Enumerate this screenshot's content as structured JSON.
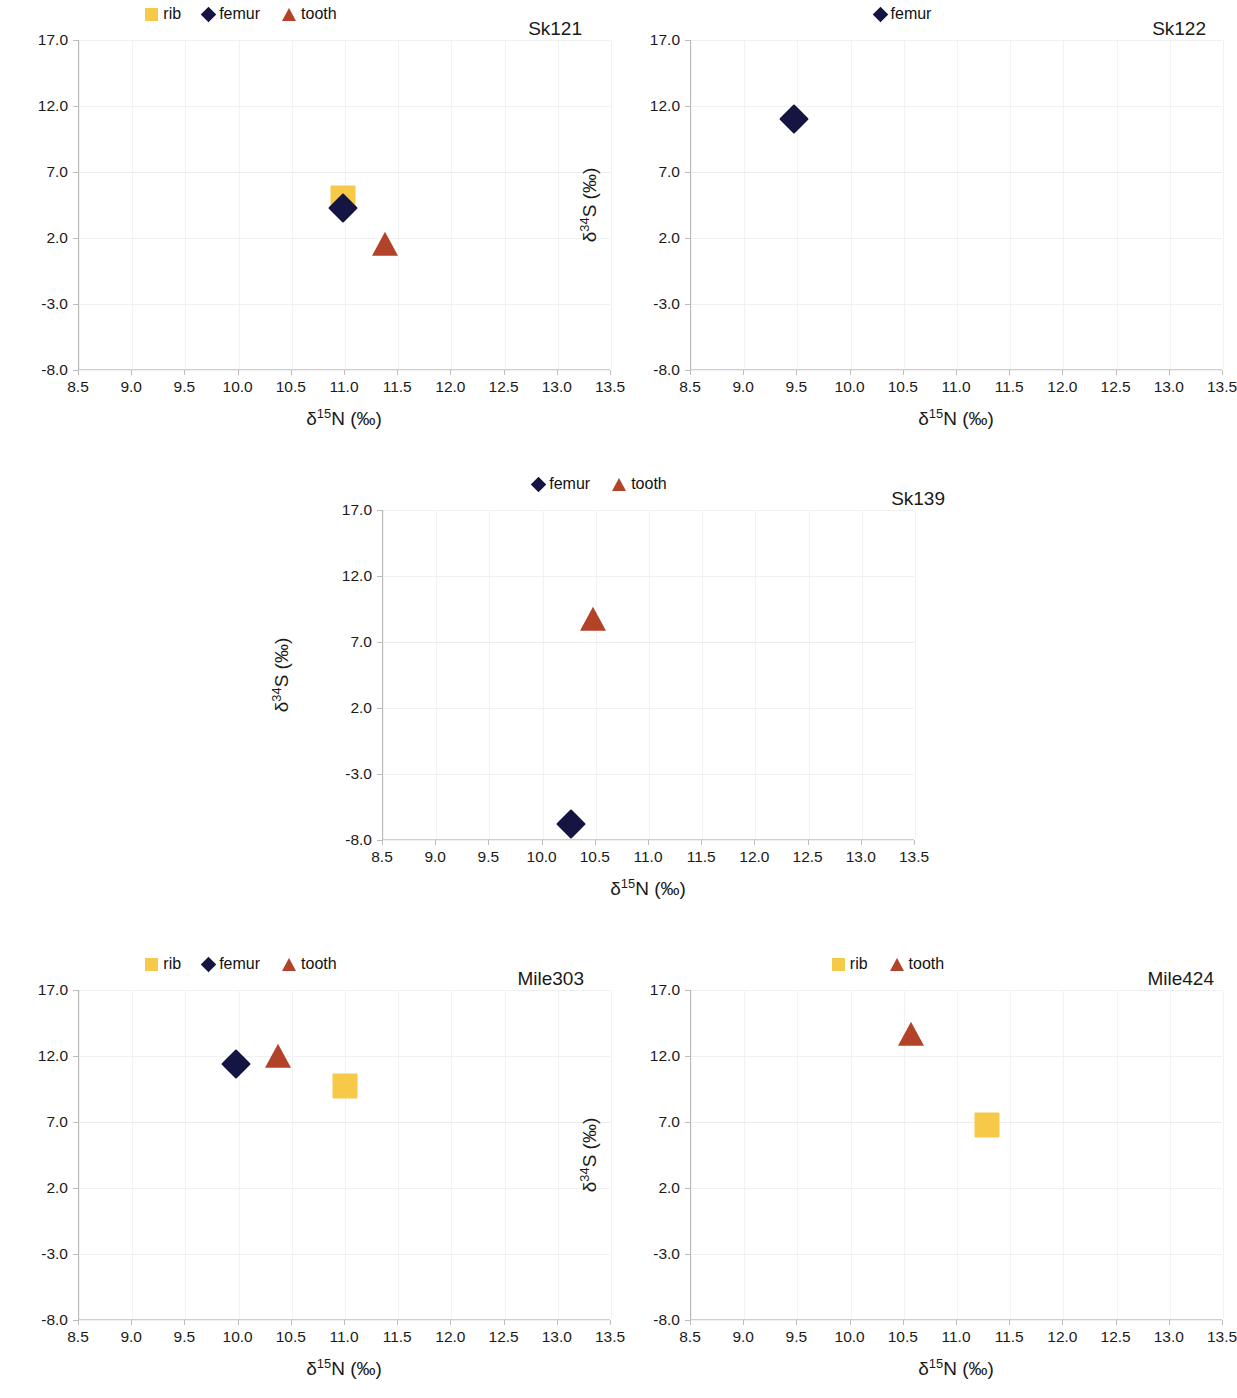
{
  "figure": {
    "axis_x_title_html": "&delta;<sup>15</sup>N (&permil;)",
    "axis_y_title_html": "&delta;<sup>34</sup>S (&permil;)",
    "colors": {
      "rib": "#f7c948",
      "femur": "#151544",
      "tooth": "#b24228",
      "gridline": "#f0f0f0",
      "axis": "#b9b9b9",
      "text": "#1a1a1a"
    }
  },
  "chart_data": [
    {
      "type": "scatter",
      "title": "Sk121",
      "xlabel": "δ15N (‰)",
      "ylabel": "δ34S (‰)",
      "xlim": [
        8.5,
        13.5
      ],
      "ylim": [
        -8.0,
        17.0
      ],
      "xticks": [
        "8.5",
        "9.0",
        "9.5",
        "10.0",
        "10.5",
        "11.0",
        "11.5",
        "12.0",
        "12.5",
        "13.0",
        "13.5"
      ],
      "yticks": [
        "17.0",
        "12.0",
        "7.0",
        "2.0",
        "-3.0",
        "-8.0"
      ],
      "grid": true,
      "legend_position": "top-center",
      "legend": [
        "rib",
        "femur",
        "tooth"
      ],
      "series": [
        {
          "name": "rib",
          "marker": "square",
          "x": [
            10.98
          ],
          "y": [
            5.0
          ]
        },
        {
          "name": "femur",
          "marker": "diamond",
          "x": [
            10.98
          ],
          "y": [
            4.3
          ]
        },
        {
          "name": "tooth",
          "marker": "triangle",
          "x": [
            11.38
          ],
          "y": [
            1.5
          ]
        }
      ]
    },
    {
      "type": "scatter",
      "title": "Sk122",
      "xlabel": "δ15N (‰)",
      "ylabel": "δ34S (‰)",
      "xlim": [
        8.5,
        13.5
      ],
      "ylim": [
        -8.0,
        17.0
      ],
      "xticks": [
        "8.5",
        "9.0",
        "9.5",
        "10.0",
        "10.5",
        "11.0",
        "11.5",
        "12.0",
        "12.5",
        "13.0",
        "13.5"
      ],
      "yticks": [
        "17.0",
        "12.0",
        "7.0",
        "2.0",
        "-3.0",
        "-8.0"
      ],
      "grid": true,
      "legend_position": "top-center",
      "legend": [
        "femur"
      ],
      "series": [
        {
          "name": "femur",
          "marker": "diamond",
          "x": [
            9.47
          ],
          "y": [
            11.0
          ]
        }
      ]
    },
    {
      "type": "scatter",
      "title": "Sk139",
      "xlabel": "δ15N (‰)",
      "ylabel": "δ34S (‰)",
      "xlim": [
        8.5,
        13.5
      ],
      "ylim": [
        -8.0,
        17.0
      ],
      "xticks": [
        "8.5",
        "9.0",
        "9.5",
        "10.0",
        "10.5",
        "11.0",
        "11.5",
        "12.0",
        "12.5",
        "13.0",
        "13.5"
      ],
      "yticks": [
        "17.0",
        "12.0",
        "7.0",
        "2.0",
        "-3.0",
        "-8.0"
      ],
      "grid": true,
      "legend_position": "top-center",
      "legend": [
        "femur",
        "tooth"
      ],
      "series": [
        {
          "name": "femur",
          "marker": "diamond",
          "x": [
            10.27
          ],
          "y": [
            -6.8
          ]
        },
        {
          "name": "tooth",
          "marker": "triangle",
          "x": [
            10.47
          ],
          "y": [
            8.7
          ]
        }
      ]
    },
    {
      "type": "scatter",
      "title": "Mile303",
      "xlabel": "δ15N (‰)",
      "ylabel": "δ34S (‰)",
      "xlim": [
        8.5,
        13.5
      ],
      "ylim": [
        -8.0,
        17.0
      ],
      "xticks": [
        "8.5",
        "9.0",
        "9.5",
        "10.0",
        "10.5",
        "11.0",
        "11.5",
        "12.0",
        "12.5",
        "13.0",
        "13.5"
      ],
      "yticks": [
        "17.0",
        "12.0",
        "7.0",
        "2.0",
        "-3.0",
        "-8.0"
      ],
      "grid": true,
      "legend_position": "top-center",
      "legend": [
        "rib",
        "femur",
        "tooth"
      ],
      "series": [
        {
          "name": "rib",
          "marker": "square",
          "x": [
            11.0
          ],
          "y": [
            9.7
          ]
        },
        {
          "name": "femur",
          "marker": "diamond",
          "x": [
            9.98
          ],
          "y": [
            11.4
          ]
        },
        {
          "name": "tooth",
          "marker": "triangle",
          "x": [
            10.37
          ],
          "y": [
            11.9
          ]
        }
      ]
    },
    {
      "type": "scatter",
      "title": "Mile424",
      "xlabel": "δ15N (‰)",
      "ylabel": "δ34S (‰)",
      "xlim": [
        8.5,
        13.5
      ],
      "ylim": [
        -8.0,
        17.0
      ],
      "xticks": [
        "8.5",
        "9.0",
        "9.5",
        "10.0",
        "10.5",
        "11.0",
        "11.5",
        "12.0",
        "12.5",
        "13.0",
        "13.5"
      ],
      "yticks": [
        "17.0",
        "12.0",
        "7.0",
        "2.0",
        "-3.0",
        "-8.0"
      ],
      "grid": true,
      "legend_position": "top-center",
      "legend": [
        "rib",
        "tooth"
      ],
      "series": [
        {
          "name": "rib",
          "marker": "square",
          "x": [
            11.28
          ],
          "y": [
            6.8
          ]
        },
        {
          "name": "tooth",
          "marker": "triangle",
          "x": [
            10.57
          ],
          "y": [
            13.6
          ]
        }
      ]
    }
  ]
}
